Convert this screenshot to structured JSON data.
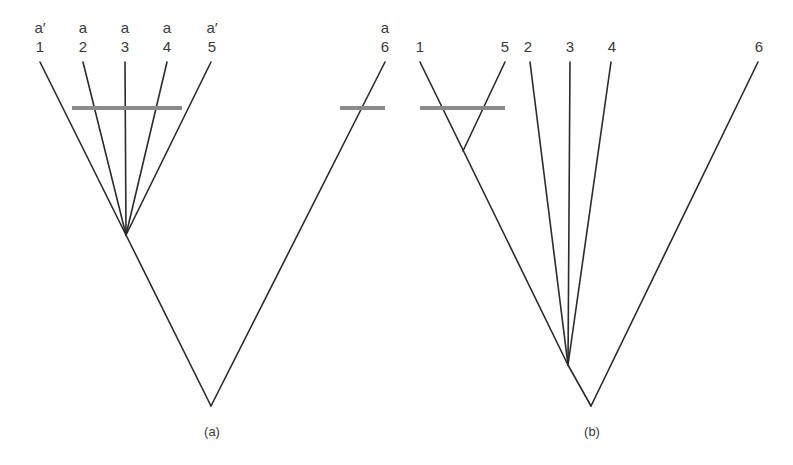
{
  "diagram": {
    "type": "phylogenetic-trees",
    "panels": [
      {
        "id": "a",
        "label": "(a)",
        "taxa": [
          {
            "number": "1",
            "state": "a′"
          },
          {
            "number": "2",
            "state": "a"
          },
          {
            "number": "3",
            "state": "a"
          },
          {
            "number": "4",
            "state": "a"
          },
          {
            "number": "5",
            "state": "a′"
          },
          {
            "number": "6",
            "state": "a"
          }
        ],
        "topology": "((1,2,3,4,5),6)",
        "character_change_marks": [
          "across branches 1-5",
          "on branch 6"
        ]
      },
      {
        "id": "b",
        "label": "(b)",
        "taxa": [
          {
            "number": "1"
          },
          {
            "number": "5"
          },
          {
            "number": "2"
          },
          {
            "number": "3"
          },
          {
            "number": "4"
          },
          {
            "number": "6"
          }
        ],
        "topology": "(((1,5),2,3,4),6)",
        "character_change_marks": [
          "on stem of clade (1,5)"
        ]
      }
    ]
  },
  "colors": {
    "line": "#2b2b2b",
    "mark": "#8a8a8a"
  }
}
